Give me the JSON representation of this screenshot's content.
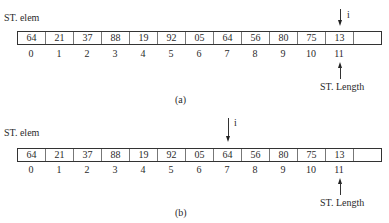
{
  "figures": [
    {
      "caption": "(a)",
      "array_label": "ST. elem",
      "length_label": "ST. Length",
      "pointer_label": "i",
      "pointer_index": 11,
      "length_index": 11,
      "cells": [
        "64",
        "21",
        "37",
        "88",
        "19",
        "92",
        "05",
        "64",
        "56",
        "80",
        "75",
        "13",
        ""
      ],
      "indices": [
        "0",
        "1",
        "2",
        "3",
        "4",
        "5",
        "6",
        "7",
        "8",
        "9",
        "10",
        "11"
      ]
    },
    {
      "caption": "(b)",
      "array_label": "ST. elem",
      "length_label": "ST. Length",
      "pointer_label": "i",
      "pointer_index": 7,
      "length_index": 11,
      "cells": [
        "64",
        "21",
        "37",
        "88",
        "19",
        "92",
        "05",
        "64",
        "56",
        "80",
        "75",
        "13",
        ""
      ],
      "indices": [
        "0",
        "1",
        "2",
        "3",
        "4",
        "5",
        "6",
        "7",
        "8",
        "9",
        "10",
        "11"
      ]
    }
  ]
}
